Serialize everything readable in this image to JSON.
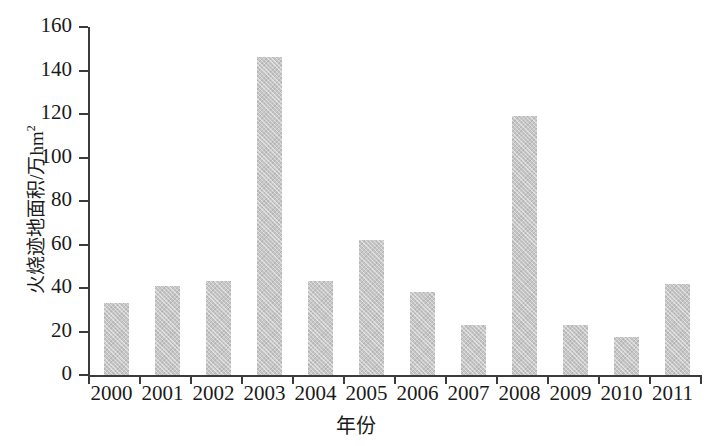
{
  "chart_data": {
    "type": "bar",
    "title": "",
    "xlabel": "年份",
    "ylabel": "火烧迹地面积/万hm²",
    "ylabel_main": "火烧迹地面积/万hm",
    "ylabel_sup": "2",
    "categories": [
      "2000",
      "2001",
      "2002",
      "2003",
      "2004",
      "2005",
      "2006",
      "2007",
      "2008",
      "2009",
      "2010",
      "2011"
    ],
    "values": [
      33,
      41,
      43,
      146,
      43,
      62,
      38,
      23,
      119,
      23,
      17.5,
      42
    ],
    "ylim": [
      0,
      160
    ],
    "yticks": [
      0,
      20,
      40,
      60,
      80,
      100,
      120,
      140,
      160
    ],
    "ytick_labels": [
      "0",
      "20",
      "40",
      "60",
      "80",
      "100",
      "120",
      "140",
      "160"
    ],
    "grid": false,
    "legend": false,
    "bar_color": "#c6c6c6",
    "axis_color": "#3b3b3b",
    "background_color": "#ffffff"
  }
}
